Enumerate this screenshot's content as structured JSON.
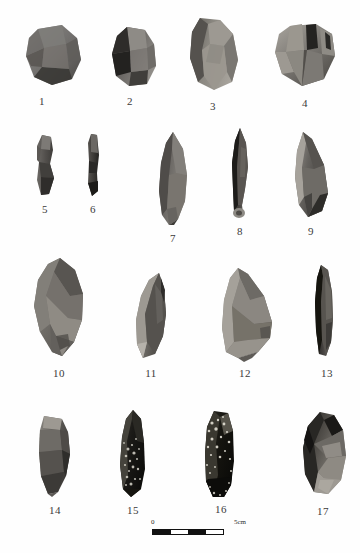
{
  "figure": {
    "kind": "archaeological-plate",
    "background": "#ffffff",
    "ink": "#3a3a3a",
    "rows": 4,
    "item_count": 17
  },
  "scale_bar": {
    "name": "scale-bar",
    "start_label": "0",
    "end_label": "5cm",
    "segments": 4,
    "colors": {
      "dark": "#111111",
      "light": "#ffffff"
    }
  },
  "caption": {
    "text": ""
  },
  "artifacts": [
    {
      "id": 1,
      "label": "1",
      "shape": "angular-core",
      "x": 22,
      "y": 22,
      "w": 62,
      "h": 66,
      "tone": "#6f6d6b",
      "tone2": "#4a4845",
      "tone3": "#8c8a86"
    },
    {
      "id": 2,
      "label": "2",
      "shape": "blocky-core",
      "x": 107,
      "y": 24,
      "w": 52,
      "h": 65,
      "tone": "#6a6764",
      "tone2": "#2e2c2a",
      "tone3": "#908d88"
    },
    {
      "id": 3,
      "label": "3",
      "shape": "prismatic-core",
      "x": 186,
      "y": 16,
      "w": 55,
      "h": 76,
      "tone": "#78756f",
      "tone2": "#55524e",
      "tone3": "#a7a39c"
    },
    {
      "id": 4,
      "label": "4",
      "shape": "discoid-core",
      "x": 272,
      "y": 22,
      "w": 66,
      "h": 66,
      "tone": "#7c7974",
      "tone2": "#4f4c48",
      "tone3": "#a9a59e"
    },
    {
      "id": 5,
      "label": "5",
      "shape": "narrow-blade",
      "x": 35,
      "y": 134,
      "w": 22,
      "h": 63,
      "tone": "#5d5a57",
      "tone2": "#3b3936",
      "tone3": "#85827d"
    },
    {
      "id": 6,
      "label": "6",
      "shape": "narrow-blade",
      "x": 86,
      "y": 133,
      "w": 15,
      "h": 64,
      "tone": "#4d4b48",
      "tone2": "#2b2a28",
      "tone3": "#726f6b"
    },
    {
      "id": 7,
      "label": "7",
      "shape": "pointed-flake",
      "x": 156,
      "y": 131,
      "w": 34,
      "h": 96,
      "tone": "#66635f",
      "tone2": "#45423f",
      "tone3": "#8f8c86"
    },
    {
      "id": 8,
      "label": "8",
      "shape": "slender-point",
      "x": 229,
      "y": 127,
      "w": 22,
      "h": 93,
      "tone": "#3b3936",
      "tone2": "#1e1d1b",
      "tone3": "#6d6a66"
    },
    {
      "id": 9,
      "label": "9",
      "shape": "convergent-flake",
      "x": 292,
      "y": 131,
      "w": 38,
      "h": 90,
      "tone": "#5f5c58",
      "tone2": "#3c3a37",
      "tone3": "#9c9892"
    },
    {
      "id": 10,
      "label": "10",
      "shape": "leaf-point-large",
      "x": 30,
      "y": 256,
      "w": 58,
      "h": 105,
      "tone": "#716e69",
      "tone2": "#4b4845",
      "tone3": "#9a968f"
    },
    {
      "id": 11,
      "label": "11",
      "shape": "leaf-point-small",
      "x": 133,
      "y": 272,
      "w": 35,
      "h": 88,
      "tone": "#6a6763",
      "tone2": "#403e3b",
      "tone3": "#a5a19a"
    },
    {
      "id": 12,
      "label": "12",
      "shape": "broad-sidescraper",
      "x": 214,
      "y": 266,
      "w": 62,
      "h": 96,
      "tone": "#7b7872",
      "tone2": "#55524e",
      "tone3": "#a8a49d"
    },
    {
      "id": 13,
      "label": "13",
      "shape": "narrow-sidescraper",
      "x": 312,
      "y": 264,
      "w": 24,
      "h": 96,
      "tone": "#4a4744",
      "tone2": "#262523",
      "tone3": "#7a7772"
    },
    {
      "id": 14,
      "label": "14",
      "shape": "trapezoid-flake",
      "x": 36,
      "y": 414,
      "w": 38,
      "h": 83,
      "tone": "#5d5a56",
      "tone2": "#3a3835",
      "tone3": "#8a8781"
    },
    {
      "id": 15,
      "label": "15",
      "shape": "speckled-blade",
      "x": 117,
      "y": 409,
      "w": 31,
      "h": 90,
      "tone": "#25241f",
      "tone2": "#0e0e0c",
      "tone3": "#c9c6bc"
    },
    {
      "id": 16,
      "label": "16",
      "shape": "speckled-blade",
      "x": 202,
      "y": 409,
      "w": 35,
      "h": 92,
      "tone": "#1e1d1a",
      "tone2": "#0b0b09",
      "tone3": "#d6d3c9"
    },
    {
      "id": 17,
      "label": "17",
      "shape": "ovate-biface",
      "x": 300,
      "y": 410,
      "w": 48,
      "h": 88,
      "tone": "#4e4b47",
      "tone2": "#232220",
      "tone3": "#a09c95"
    }
  ],
  "labels_positions": [
    {
      "n": 1,
      "x": 27,
      "y": 95
    },
    {
      "n": 2,
      "x": 115,
      "y": 95
    },
    {
      "n": 3,
      "x": 198,
      "y": 100
    },
    {
      "n": 4,
      "x": 290,
      "y": 97
    },
    {
      "n": 5,
      "x": 30,
      "y": 203
    },
    {
      "n": 6,
      "x": 78,
      "y": 203
    },
    {
      "n": 7,
      "x": 158,
      "y": 232
    },
    {
      "n": 8,
      "x": 225,
      "y": 225
    },
    {
      "n": 9,
      "x": 296,
      "y": 225
    },
    {
      "n": 10,
      "x": 44,
      "y": 367
    },
    {
      "n": 11,
      "x": 136,
      "y": 367
    },
    {
      "n": 12,
      "x": 230,
      "y": 367
    },
    {
      "n": 13,
      "x": 312,
      "y": 367
    },
    {
      "n": 14,
      "x": 40,
      "y": 504
    },
    {
      "n": 15,
      "x": 118,
      "y": 504
    },
    {
      "n": 16,
      "x": 206,
      "y": 503
    },
    {
      "n": 17,
      "x": 308,
      "y": 505
    }
  ]
}
